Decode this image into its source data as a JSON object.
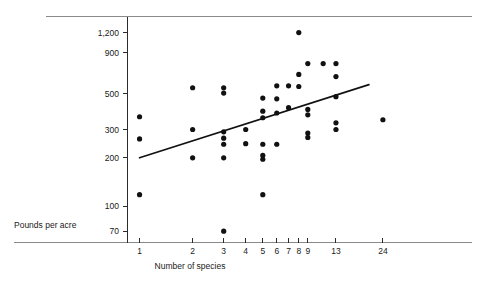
{
  "chart_data": {
    "type": "scatter",
    "title": "",
    "subtitle": "",
    "xlabel": "Number of species",
    "ylabel": "Pounds per acre",
    "xscale": "log",
    "yscale": "log",
    "xlim": [
      0.86,
      30
    ],
    "ylim": [
      60,
      1500
    ],
    "grid": false,
    "legend": null,
    "xticks": [
      1,
      2,
      3,
      4,
      5,
      6,
      7,
      8,
      9,
      13,
      24
    ],
    "xticklabels": [
      "1",
      "2",
      "3",
      "4",
      "5",
      "6",
      "7",
      "8",
      "9",
      "13",
      "24"
    ],
    "yticks": [
      70,
      100,
      200,
      300,
      500,
      900,
      1200
    ],
    "yticklabels": [
      "70",
      "100",
      "200",
      "300",
      "500",
      "900",
      "1,200"
    ],
    "points": [
      {
        "x": 1,
        "y": 360
      },
      {
        "x": 1,
        "y": 262
      },
      {
        "x": 1,
        "y": 118
      },
      {
        "x": 2,
        "y": 545
      },
      {
        "x": 2,
        "y": 300
      },
      {
        "x": 2,
        "y": 200
      },
      {
        "x": 3,
        "y": 545
      },
      {
        "x": 3,
        "y": 505
      },
      {
        "x": 3,
        "y": 290
      },
      {
        "x": 3,
        "y": 265
      },
      {
        "x": 3,
        "y": 243
      },
      {
        "x": 3,
        "y": 200
      },
      {
        "x": 3,
        "y": 70
      },
      {
        "x": 4,
        "y": 300
      },
      {
        "x": 4,
        "y": 245
      },
      {
        "x": 5,
        "y": 470
      },
      {
        "x": 5,
        "y": 390
      },
      {
        "x": 5,
        "y": 355
      },
      {
        "x": 5,
        "y": 243
      },
      {
        "x": 5,
        "y": 207
      },
      {
        "x": 5,
        "y": 196
      },
      {
        "x": 5,
        "y": 118
      },
      {
        "x": 6,
        "y": 560
      },
      {
        "x": 6,
        "y": 465
      },
      {
        "x": 6,
        "y": 380
      },
      {
        "x": 6,
        "y": 243
      },
      {
        "x": 7,
        "y": 560
      },
      {
        "x": 7,
        "y": 410
      },
      {
        "x": 8,
        "y": 1200
      },
      {
        "x": 8,
        "y": 660
      },
      {
        "x": 8,
        "y": 555
      },
      {
        "x": 9,
        "y": 770
      },
      {
        "x": 9,
        "y": 400
      },
      {
        "x": 9,
        "y": 370
      },
      {
        "x": 9,
        "y": 285
      },
      {
        "x": 9,
        "y": 268
      },
      {
        "x": 11,
        "y": 770
      },
      {
        "x": 13,
        "y": 770
      },
      {
        "x": 13,
        "y": 640
      },
      {
        "x": 13,
        "y": 480
      },
      {
        "x": 13,
        "y": 330
      },
      {
        "x": 13,
        "y": 300
      },
      {
        "x": 24,
        "y": 345
      }
    ],
    "fit_line": {
      "name": "least-squares fit",
      "x_start": 1,
      "y_start": 200,
      "x_end": 20,
      "y_end": 570
    },
    "annotations": []
  }
}
